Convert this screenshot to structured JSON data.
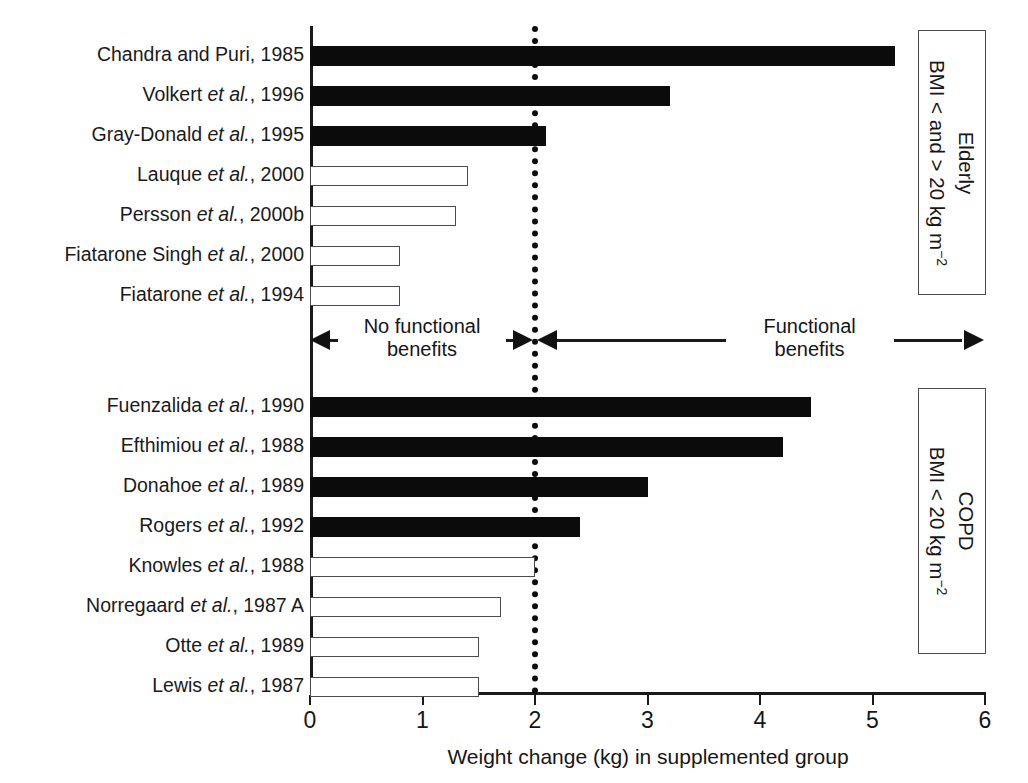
{
  "chart_data": {
    "type": "bar",
    "orientation": "horizontal",
    "title": "",
    "xlabel": "Weight change (kg) in supplemented group",
    "ylabel": "",
    "xlim": [
      0,
      6
    ],
    "xticks": [
      0,
      1,
      2,
      3,
      4,
      5,
      6
    ],
    "xticklabels": [
      "0",
      "1",
      "2",
      "3",
      "4",
      "5",
      "6"
    ],
    "grid": false,
    "reference_line": {
      "x": 2.0,
      "style": "dotted",
      "color": "#0d0d0d"
    },
    "legend": [
      {
        "label": "Functional benefits (filled bar)",
        "fill": "#0b0b0b"
      },
      {
        "label": "No functional benefits (open bar)",
        "fill": "#ffffff"
      }
    ],
    "groups": [
      {
        "name": "Elderly",
        "box_label_line1": "Elderly",
        "box_label_line2": "BMI < and > 20 kg m",
        "box_label_sup": "−2",
        "categories": [
          "Chandra and Puri, 1985",
          "Volkert et al., 1996",
          "Gray-Donald et al., 1995",
          "Lauque et al., 2000",
          "Persson et al., 2000b",
          "Fiatarone Singh et al., 2000",
          "Fiatarone et al., 1994"
        ],
        "values": [
          5.2,
          3.2,
          2.1,
          1.4,
          1.3,
          0.8,
          0.8
        ],
        "filled": [
          true,
          true,
          true,
          false,
          false,
          false,
          false
        ]
      },
      {
        "name": "COPD",
        "box_label_line1": "COPD",
        "box_label_line2": "BMI < 20 kg m",
        "box_label_sup": "−2",
        "categories": [
          "Fuenzalida et al., 1990",
          "Efthimiou et al., 1988",
          "Donahoe et al., 1989",
          "Rogers et al., 1992",
          "Knowles et al., 1988",
          "Norregaard et al., 1987 A",
          "Otte et al., 1989",
          "Lewis et al., 1987"
        ],
        "values": [
          4.45,
          4.2,
          3.0,
          2.4,
          2.0,
          1.7,
          1.5,
          1.5
        ],
        "filled": [
          true,
          true,
          true,
          true,
          false,
          false,
          false,
          false
        ]
      }
    ],
    "annotations": {
      "left_text_line1": "No functional",
      "left_text_line2": "benefits",
      "right_text_line1": "Functional",
      "right_text_line2": "benefits",
      "left_arrow_direction": "left",
      "right_arrow_direction": "right",
      "split_at_x": 2.0
    }
  },
  "labels": {
    "elderly": [
      {
        "author": "Chandra and Puri,",
        "italic": "",
        "year": "1985",
        "plain": "Chandra and Puri, 1985"
      },
      {
        "author": "Volkert",
        "italic": "et al.",
        "year": ", 1996",
        "plain": "Volkert et al., 1996"
      },
      {
        "author": "Gray-Donald",
        "italic": "et al.",
        "year": ", 1995",
        "plain": "Gray-Donald et al., 1995"
      },
      {
        "author": "Lauque",
        "italic": "et al.",
        "year": ", 2000",
        "plain": "Lauque et al., 2000"
      },
      {
        "author": "Persson",
        "italic": "et al.",
        "year": ", 2000b",
        "plain": "Persson et al., 2000b"
      },
      {
        "author": "Fiatarone Singh",
        "italic": "et al.",
        "year": ", 2000",
        "plain": "Fiatarone Singh et al., 2000"
      },
      {
        "author": "Fiatarone",
        "italic": "et al.",
        "year": ", 1994",
        "plain": "Fiatarone et al., 1994"
      }
    ],
    "copd": [
      {
        "author": "Fuenzalida",
        "italic": "et al.",
        "year": ", 1990",
        "plain": "Fuenzalida et al., 1990"
      },
      {
        "author": "Efthimiou",
        "italic": "et al.",
        "year": ", 1988",
        "plain": "Efthimiou et al., 1988"
      },
      {
        "author": "Donahoe",
        "italic": "et al.",
        "year": ", 1989",
        "plain": "Donahoe et al., 1989"
      },
      {
        "author": "Rogers",
        "italic": "et al.",
        "year": ", 1992",
        "plain": "Rogers et al., 1992"
      },
      {
        "author": "Knowles",
        "italic": "et al.",
        "year": ", 1988",
        "plain": "Knowles et al., 1988"
      },
      {
        "author": "Norregaard",
        "italic": "et al.",
        "year": ", 1987 A",
        "plain": "Norregaard et al., 1987 A"
      },
      {
        "author": "Otte",
        "italic": "et al.",
        "year": ", 1989",
        "plain": "Otte et al., 1989"
      },
      {
        "author": "Lewis",
        "italic": "et al.",
        "year": ", 1987",
        "plain": "Lewis et al., 1987"
      }
    ]
  },
  "colors": {
    "filled_bar": "#0b0b0b",
    "open_bar_stroke": "#4c4c4c",
    "axis": "#1a1a1a",
    "text": "#161616",
    "background": "#ffffff"
  }
}
